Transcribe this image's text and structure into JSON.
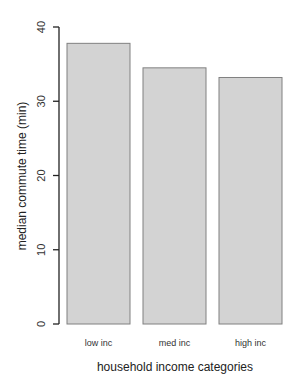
{
  "chart_data": {
    "type": "bar",
    "title": "",
    "xlabel": "household income categories",
    "ylabel": "median commute time (min)",
    "categories": [
      "low inc",
      "med inc",
      "high inc"
    ],
    "values": [
      37.8,
      34.5,
      33.2
    ],
    "ylim": [
      0,
      40
    ],
    "yticks": [
      0,
      10,
      20,
      30,
      40
    ],
    "grid": false,
    "legend": null,
    "bar_color": "#d3d3d3",
    "bar_border_color": "#808080"
  }
}
